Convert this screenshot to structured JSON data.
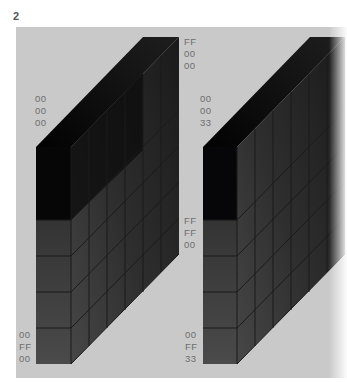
{
  "figure": {
    "number": "2"
  },
  "colors": {
    "panel": "#c9c9c9",
    "label": "#6e6e6e",
    "grid_line": "#1a1a1a"
  },
  "left_cube": {
    "labels": {
      "back_top": [
        "FF",
        "00",
        "00"
      ],
      "front_top": [
        "00",
        "00",
        "00"
      ],
      "side_middle": [
        "FF",
        "FF",
        "00"
      ],
      "front_bottom": [
        "00",
        "FF",
        "00"
      ]
    }
  },
  "right_cube": {
    "labels": {
      "front_top": [
        "00",
        "00",
        "33"
      ],
      "front_bottom": [
        "00",
        "FF",
        "33"
      ]
    }
  }
}
